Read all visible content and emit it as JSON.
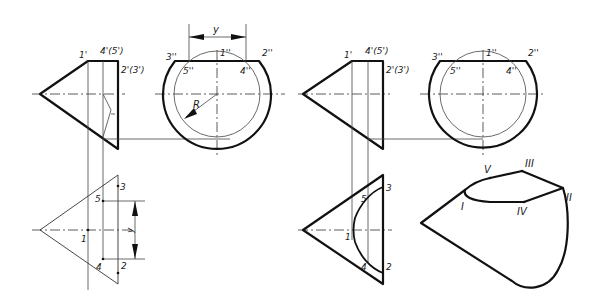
{
  "figure": {
    "left_panel": {
      "front_view": {
        "labels": {
          "p1": "1'",
          "p45": "4'(5')",
          "p23": "2'(3')"
        }
      },
      "side_view": {
        "labels": {
          "p3": "3''",
          "p1": "1''",
          "p2": "2''",
          "p5": "5''",
          "p4": "4''",
          "radius": "R",
          "dim": "y"
        }
      },
      "top_view": {
        "labels": {
          "p1": "1",
          "p2": "2",
          "p3": "3",
          "p4": "4",
          "p5": "5",
          "dim": "y"
        }
      }
    },
    "right_panel": {
      "front_view": {
        "labels": {
          "p1": "1'",
          "p45": "4'(5')",
          "p23": "2'(3')"
        }
      },
      "side_view": {
        "labels": {
          "p3": "3''",
          "p1": "1''",
          "p2": "2''",
          "p5": "5''",
          "p4": "4''"
        }
      },
      "top_view": {
        "labels": {
          "p1": "1",
          "p2": "2",
          "p3": "3",
          "p4": "4",
          "p5": "5"
        }
      },
      "isometric_view": {
        "labels": {
          "I": "I",
          "II": "II",
          "III": "III",
          "IV": "IV",
          "V": "V"
        }
      }
    }
  }
}
